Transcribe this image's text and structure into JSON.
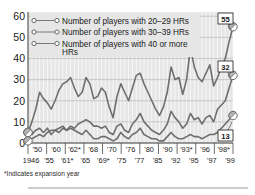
{
  "chart_data": {
    "type": "line",
    "title": "",
    "xlabel": "",
    "ylabel": "",
    "ylim": [
      0,
      62
    ],
    "yticks": [
      0,
      10,
      20,
      30,
      40,
      50,
      60
    ],
    "grid": true,
    "legend_position": "top-left",
    "footnote": "*Indicates expansion year",
    "x_start_year": 1946,
    "x_end_year": 1999,
    "xtick_labels_top": [
      "'50",
      "'60",
      "'62*",
      "'68",
      "'70",
      "'76",
      "'80",
      "'90",
      "'93*",
      "'96",
      "'98*"
    ],
    "xtick_labels_bottom": [
      "1946",
      "'55",
      "'61*",
      "'65",
      "'69*",
      "'75",
      "'77",
      "'85",
      "'92",
      "'95",
      "'97",
      "'99"
    ],
    "series": [
      {
        "name": "Number of players with 20–29 HRs",
        "end_label": "55",
        "values": [
          5,
          10,
          16,
          24,
          21,
          19,
          16,
          20,
          25,
          28,
          29,
          31,
          26,
          22,
          24,
          31,
          28,
          21,
          22,
          26,
          24,
          17,
          12,
          22,
          28,
          24,
          20,
          26,
          32,
          33,
          28,
          24,
          20,
          16,
          13,
          17,
          24,
          36,
          30,
          31,
          23,
          30,
          45,
          36,
          31,
          29,
          33,
          37,
          27,
          31,
          36,
          40,
          48,
          55
        ]
      },
      {
        "name": "Number of players with 30–39 HRs",
        "end_label": "32",
        "values": [
          5,
          4,
          6,
          7,
          5,
          7,
          4,
          6,
          7,
          8,
          6,
          8,
          7,
          9,
          10,
          11,
          10,
          8,
          8,
          7,
          8,
          5,
          4,
          8,
          9,
          6,
          5,
          9,
          11,
          14,
          10,
          8,
          6,
          5,
          4,
          6,
          9,
          15,
          12,
          10,
          7,
          9,
          14,
          11,
          12,
          9,
          12,
          13,
          10,
          16,
          18,
          20,
          26,
          32
        ]
      },
      {
        "name": "Number of players with 40 or more HRs",
        "end_label": "13",
        "values": [
          1,
          2,
          3,
          4,
          3,
          5,
          6,
          6,
          5,
          7,
          6,
          7,
          6,
          5,
          4,
          6,
          4,
          2,
          2,
          3,
          3,
          2,
          1,
          2,
          5,
          3,
          2,
          4,
          5,
          7,
          4,
          3,
          2,
          2,
          1,
          1,
          3,
          5,
          3,
          2,
          2,
          3,
          4,
          3,
          3,
          2,
          3,
          4,
          4,
          5,
          7,
          9,
          11,
          13
        ]
      }
    ]
  },
  "legend": {
    "items": [
      {
        "label": "Number of players with 20–29 HRs"
      },
      {
        "label": "Number of players with 30–39 HRs"
      },
      {
        "label": "Number of players with 40 or more",
        "label2": "HRs"
      }
    ]
  },
  "callouts": [
    {
      "value": "55"
    },
    {
      "value": "32"
    },
    {
      "value": "13"
    }
  ],
  "footnote": {
    "text": "*Indicates expansion year"
  }
}
